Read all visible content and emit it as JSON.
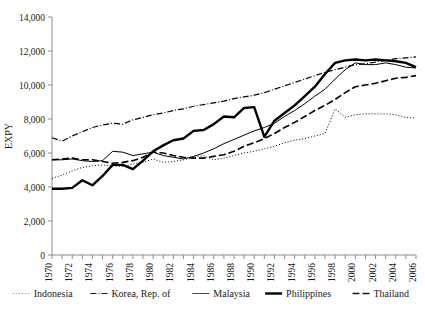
{
  "chart_data": {
    "type": "line",
    "title": "",
    "xlabel": "",
    "ylabel": "EXPY",
    "ylim": [
      0,
      14000
    ],
    "xlim": [
      1970,
      2006
    ],
    "ytick_labels": [
      "0",
      "2,000",
      "4,000",
      "6,000",
      "8,000",
      "10,000",
      "12,000",
      "14,000"
    ],
    "ytick_values": [
      0,
      2000,
      4000,
      6000,
      8000,
      10000,
      12000,
      14000
    ],
    "xtick_labels": [
      "1970",
      "1972",
      "1974",
      "1976",
      "1978",
      "1980",
      "1982",
      "1984",
      "1986",
      "1988",
      "1990",
      "1992",
      "1994",
      "1996",
      "1998",
      "2000",
      "2002",
      "2004",
      "2006"
    ],
    "xtick_values": [
      1970,
      1972,
      1974,
      1976,
      1978,
      1980,
      1982,
      1984,
      1986,
      1988,
      1990,
      1992,
      1994,
      1996,
      1998,
      2000,
      2002,
      2004,
      2006
    ],
    "minor_tick_interval": 1,
    "grid": false,
    "legend_position": "bottom",
    "x": [
      1970,
      1971,
      1972,
      1973,
      1974,
      1975,
      1976,
      1977,
      1978,
      1979,
      1980,
      1981,
      1982,
      1983,
      1984,
      1985,
      1986,
      1987,
      1988,
      1989,
      1990,
      1991,
      1992,
      1993,
      1994,
      1995,
      1996,
      1997,
      1998,
      1999,
      2000,
      2001,
      2002,
      2003,
      2004,
      2005,
      2006
    ],
    "series": [
      {
        "name": "Indonesia",
        "style": "dotted",
        "line_width": 1,
        "color": "#808080",
        "values": [
          4500,
          4700,
          4950,
          5150,
          5250,
          5300,
          5250,
          5200,
          5350,
          5450,
          5650,
          5450,
          5500,
          5600,
          5750,
          5850,
          5600,
          5700,
          5850,
          6000,
          6100,
          6250,
          6400,
          6600,
          6750,
          6850,
          7000,
          7150,
          8600,
          8100,
          8250,
          8300,
          8300,
          8300,
          8250,
          8100,
          8050
        ]
      },
      {
        "name": "Korea, Rep. of",
        "style": "dashdot",
        "line_width": 1.2,
        "color": "#1a1a1a",
        "values": [
          6900,
          6700,
          7000,
          7250,
          7500,
          7650,
          7750,
          7700,
          7950,
          8100,
          8250,
          8350,
          8500,
          8600,
          8750,
          8850,
          8950,
          9050,
          9200,
          9300,
          9400,
          9550,
          9750,
          9950,
          10150,
          10350,
          10550,
          10750,
          10900,
          11050,
          11200,
          11250,
          11350,
          11450,
          11550,
          11600,
          11650
        ]
      },
      {
        "name": "Malaysia",
        "style": "solid-thin",
        "line_width": 1,
        "color": "#4d4d4d",
        "values": [
          5600,
          5600,
          5650,
          5550,
          5500,
          5550,
          6100,
          6050,
          5850,
          5950,
          6050,
          5850,
          5750,
          5650,
          5800,
          6000,
          6250,
          6550,
          6800,
          7050,
          7300,
          7500,
          7750,
          8150,
          8500,
          8900,
          9350,
          9750,
          10350,
          10900,
          11300,
          11200,
          11200,
          11300,
          11200,
          11050,
          11000
        ]
      },
      {
        "name": "Philippines",
        "style": "solid-thick",
        "line_width": 2.4,
        "color": "#000000",
        "values": [
          3900,
          3900,
          3950,
          4400,
          4100,
          4650,
          5300,
          5300,
          5050,
          5550,
          6100,
          6450,
          6750,
          6850,
          7300,
          7350,
          7700,
          8150,
          8100,
          8650,
          8700,
          6950,
          7900,
          8350,
          8800,
          9350,
          9900,
          10650,
          11300,
          11450,
          11500,
          11450,
          11500,
          11450,
          11400,
          11300,
          11050
        ]
      },
      {
        "name": "Thailand",
        "style": "dashed",
        "line_width": 1.6,
        "color": "#1a1a1a",
        "values": [
          5600,
          5650,
          5700,
          5600,
          5600,
          5500,
          5400,
          5450,
          5550,
          5750,
          6050,
          6000,
          5850,
          5750,
          5700,
          5700,
          5800,
          5900,
          6100,
          6400,
          6600,
          6850,
          7150,
          7500,
          7800,
          8150,
          8500,
          8800,
          9150,
          9550,
          9900,
          10000,
          10100,
          10250,
          10400,
          10450,
          10550
        ]
      }
    ]
  },
  "legend": {
    "items": [
      {
        "label": "Indonesia",
        "style": "dotted"
      },
      {
        "label": "Korea, Rep. of",
        "style": "dashdot"
      },
      {
        "label": "Malaysia",
        "style": "solid-thin"
      },
      {
        "label": "Philippines",
        "style": "solid-thick"
      },
      {
        "label": "Thailand",
        "style": "dashed"
      }
    ]
  }
}
